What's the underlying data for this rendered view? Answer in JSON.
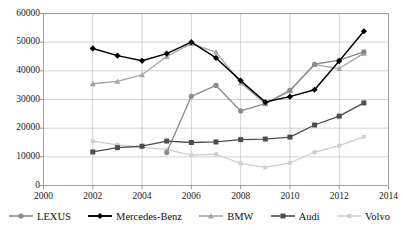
{
  "chart_data": {
    "type": "line",
    "title": "",
    "xlabel": "",
    "ylabel": "",
    "xlim": [
      2000,
      2014
    ],
    "ylim": [
      0,
      60000
    ],
    "x_ticks": [
      2000,
      2002,
      2004,
      2006,
      2008,
      2010,
      2012,
      2014
    ],
    "y_ticks": [
      0,
      10000,
      20000,
      30000,
      40000,
      50000,
      60000
    ],
    "grid": "both",
    "legend_position": "bottom",
    "x": [
      2002,
      2003,
      2004,
      2005,
      2006,
      2007,
      2008,
      2009,
      2010,
      2011,
      2012,
      2013
    ],
    "series": [
      {
        "name": "LEXUS",
        "color": "#8a8a8a",
        "marker": "circle",
        "x": [
          2005,
          2006,
          2007,
          2008,
          2009,
          2010,
          2011,
          2012,
          2013
        ],
        "values": [
          11500,
          31100,
          34900,
          26000,
          28600,
          33200,
          42300,
          43700,
          46600
        ]
      },
      {
        "name": "Mercedes-Benz",
        "color": "#000000",
        "marker": "diamond",
        "x": [
          2002,
          2003,
          2004,
          2005,
          2006,
          2007,
          2008,
          2009,
          2010,
          2011,
          2012,
          2013
        ],
        "values": [
          47800,
          45300,
          43500,
          46000,
          50000,
          44500,
          36600,
          29100,
          31000,
          33400,
          43400,
          53800
        ]
      },
      {
        "name": "BMW",
        "color": "#a6a6a6",
        "marker": "triangle",
        "x": [
          2002,
          2003,
          2004,
          2005,
          2006,
          2007,
          2008,
          2009,
          2010,
          2011,
          2012,
          2013
        ],
        "values": [
          35500,
          36300,
          38600,
          45000,
          49500,
          46500,
          35800,
          28500,
          33000,
          42200,
          40800,
          46100
        ]
      },
      {
        "name": "Audi",
        "color": "#4d4d4d",
        "marker": "square",
        "x": [
          2002,
          2003,
          2004,
          2005,
          2006,
          2007,
          2008,
          2009,
          2010,
          2011,
          2012,
          2013
        ],
        "values": [
          11700,
          13200,
          13700,
          15500,
          15000,
          15200,
          16000,
          16200,
          16900,
          21100,
          24200,
          28800
        ]
      },
      {
        "name": "Volvo",
        "color": "#cfcfcf",
        "marker": "square-small",
        "x": [
          2002,
          2003,
          2004,
          2005,
          2006,
          2007,
          2008,
          2009,
          2010,
          2011,
          2012,
          2013
        ],
        "values": [
          15500,
          14200,
          13400,
          12500,
          10600,
          10900,
          7700,
          6300,
          7900,
          11600,
          13900,
          17000
        ]
      }
    ]
  },
  "axis": {
    "y_tick_labels": [
      "60000",
      "50000",
      "40000",
      "30000",
      "20000",
      "10000",
      "0"
    ],
    "x_tick_labels": [
      "2000",
      "2002",
      "2004",
      "2006",
      "2008",
      "2010",
      "2012",
      "2014"
    ]
  },
  "legend": {
    "items": [
      {
        "label": "LEXUS",
        "color": "#8a8a8a",
        "marker": "circle"
      },
      {
        "label": "Mercedes-Benz",
        "color": "#000000",
        "marker": "diamond"
      },
      {
        "label": "BMW",
        "color": "#a6a6a6",
        "marker": "triangle"
      },
      {
        "label": "Audi",
        "color": "#4d4d4d",
        "marker": "square"
      },
      {
        "label": "Volvo",
        "color": "#cfcfcf",
        "marker": "square-small"
      }
    ]
  }
}
